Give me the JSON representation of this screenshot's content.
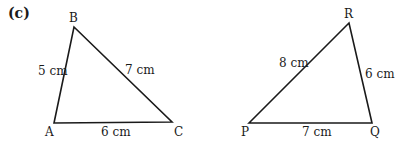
{
  "part_label": "(c)",
  "triangles": [
    {
      "vertices": {
        "A": "A",
        "B": "B",
        "C": "C"
      },
      "sides": {
        "AB": "5 cm",
        "BC": "7 cm",
        "AC": "6 cm"
      }
    },
    {
      "vertices": {
        "P": "P",
        "Q": "Q",
        "R": "R"
      },
      "sides": {
        "PR": "8 cm",
        "RQ": "6 cm",
        "PQ": "7 cm"
      }
    }
  ]
}
